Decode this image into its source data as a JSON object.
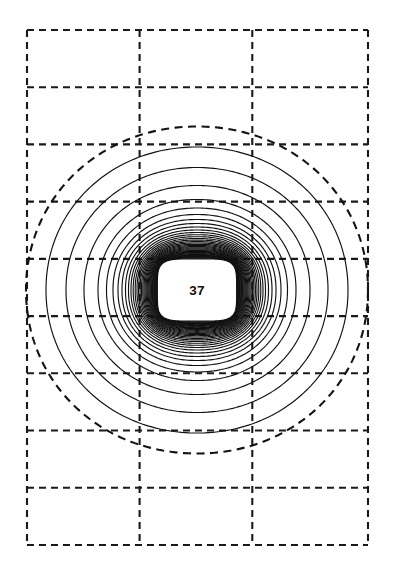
{
  "figure": {
    "title": "",
    "width": 395,
    "height": 580,
    "background_color": "#ffffff",
    "line_color": "#111111",
    "grid_color": "#1a1a1a"
  },
  "labels": {
    "peak_value": "37"
  },
  "chart_data": {
    "type": "contour",
    "title": "",
    "xlabel": "",
    "ylabel": "",
    "grid": true,
    "legend": null,
    "annotations": [
      {
        "text": "37",
        "x": 197,
        "y": 290,
        "role": "peak-contour-level-label"
      }
    ],
    "grid_lines": {
      "style": "dashed",
      "color": "#1a1a1a",
      "x_positions": [
        27,
        139.6,
        252.3,
        368
      ],
      "y_positions": [
        30,
        87.2,
        144.4,
        201.6,
        258.9,
        316.1,
        373.3,
        430.5,
        487.8,
        545
      ],
      "x_range": [
        27,
        368
      ],
      "y_range": [
        30,
        545
      ],
      "columns": 3,
      "rows": 9
    },
    "field": {
      "center_x": 197,
      "center_y": 290,
      "peak_level": 37,
      "shape": "elliptical-superellipse",
      "notes": "Concentric closed contour rings around a single central maximum; spacing tightens toward the core."
    },
    "contours": [
      {
        "level": 1,
        "rx": 171.0,
        "ry": 163.5,
        "n": 2.05,
        "style": "dashed"
      },
      {
        "level": 2,
        "rx": 151.0,
        "ry": 143.0,
        "n": 2.05,
        "style": "solid"
      },
      {
        "level": 3,
        "rx": 131.0,
        "ry": 122.5,
        "n": 2.06,
        "style": "solid"
      },
      {
        "level": 4,
        "rx": 113.0,
        "ry": 104.5,
        "n": 2.08,
        "style": "solid"
      },
      {
        "level": 5,
        "rx": 99.0,
        "ry": 90.5,
        "n": 2.1,
        "style": "solid"
      },
      {
        "level": 6,
        "rx": 90.5,
        "ry": 82.0,
        "n": 2.12,
        "style": "solid"
      },
      {
        "level": 7,
        "rx": 84.0,
        "ry": 75.5,
        "n": 2.14,
        "style": "solid"
      },
      {
        "level": 8,
        "rx": 79.0,
        "ry": 70.5,
        "n": 2.17,
        "style": "solid"
      },
      {
        "level": 9,
        "rx": 75.0,
        "ry": 66.5,
        "n": 2.2,
        "style": "solid"
      },
      {
        "level": 10,
        "rx": 71.5,
        "ry": 63.0,
        "n": 2.23,
        "style": "solid"
      },
      {
        "level": 11,
        "rx": 68.5,
        "ry": 60.0,
        "n": 2.26,
        "style": "solid"
      },
      {
        "level": 12,
        "rx": 66.0,
        "ry": 57.5,
        "n": 2.29,
        "style": "solid"
      },
      {
        "level": 13,
        "rx": 63.8,
        "ry": 55.3,
        "n": 2.32,
        "style": "solid"
      },
      {
        "level": 14,
        "rx": 61.8,
        "ry": 53.3,
        "n": 2.36,
        "style": "solid"
      },
      {
        "level": 15,
        "rx": 60.0,
        "ry": 51.5,
        "n": 2.4,
        "style": "solid"
      },
      {
        "level": 16,
        "rx": 58.4,
        "ry": 49.9,
        "n": 2.44,
        "style": "solid"
      },
      {
        "level": 17,
        "rx": 56.9,
        "ry": 48.4,
        "n": 2.48,
        "style": "solid"
      },
      {
        "level": 18,
        "rx": 55.5,
        "ry": 47.0,
        "n": 2.53,
        "style": "solid"
      },
      {
        "level": 19,
        "rx": 54.2,
        "ry": 45.7,
        "n": 2.58,
        "style": "solid"
      },
      {
        "level": 20,
        "rx": 53.0,
        "ry": 44.5,
        "n": 2.63,
        "style": "solid"
      },
      {
        "level": 21,
        "rx": 51.9,
        "ry": 43.4,
        "n": 2.68,
        "style": "solid"
      },
      {
        "level": 22,
        "rx": 50.8,
        "ry": 42.3,
        "n": 2.74,
        "style": "solid"
      },
      {
        "level": 23,
        "rx": 49.8,
        "ry": 41.3,
        "n": 2.8,
        "style": "solid"
      },
      {
        "level": 24,
        "rx": 48.8,
        "ry": 40.3,
        "n": 2.86,
        "style": "solid"
      },
      {
        "level": 25,
        "rx": 47.9,
        "ry": 39.4,
        "n": 2.92,
        "style": "solid"
      },
      {
        "level": 26,
        "rx": 47.0,
        "ry": 38.5,
        "n": 2.99,
        "style": "solid"
      },
      {
        "level": 27,
        "rx": 46.2,
        "ry": 37.7,
        "n": 3.06,
        "style": "solid"
      },
      {
        "level": 28,
        "rx": 45.4,
        "ry": 36.9,
        "n": 3.13,
        "style": "solid"
      },
      {
        "level": 29,
        "rx": 44.6,
        "ry": 36.1,
        "n": 3.21,
        "style": "solid"
      },
      {
        "level": 30,
        "rx": 43.9,
        "ry": 35.4,
        "n": 3.29,
        "style": "solid"
      },
      {
        "level": 31,
        "rx": 43.2,
        "ry": 34.7,
        "n": 3.38,
        "style": "solid"
      },
      {
        "level": 32,
        "rx": 42.5,
        "ry": 34.0,
        "n": 3.48,
        "style": "solid"
      },
      {
        "level": 33,
        "rx": 41.9,
        "ry": 33.4,
        "n": 3.6,
        "style": "solid"
      },
      {
        "level": 34,
        "rx": 41.3,
        "ry": 32.8,
        "n": 3.75,
        "style": "solid"
      },
      {
        "level": 35,
        "rx": 40.7,
        "ry": 32.2,
        "n": 3.95,
        "style": "solid"
      },
      {
        "level": 36,
        "rx": 40.2,
        "ry": 31.7,
        "n": 4.2,
        "style": "solid"
      },
      {
        "level": 37,
        "rx": 39.7,
        "ry": 31.2,
        "n": 4.6,
        "style": "core"
      }
    ]
  }
}
